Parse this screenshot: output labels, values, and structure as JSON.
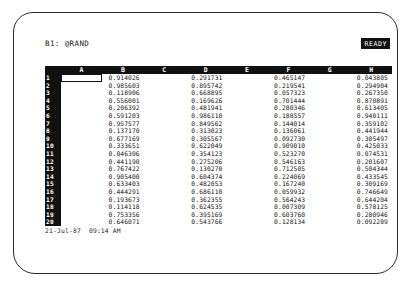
{
  "app": {
    "title": "Lotus 1-2-3 Spreadsheet",
    "screen_kind": "crt-monitor"
  },
  "control_panel": {
    "cell_reference": "B1: @RAND",
    "mode_indicator": "READY"
  },
  "worksheet": {
    "column_headers": [
      "A",
      "B",
      "C",
      "D",
      "E",
      "F",
      "G",
      "H"
    ],
    "row_numbers": [
      "1",
      "2",
      "3",
      "4",
      "5",
      "6",
      "7",
      "8",
      "9",
      "10",
      "11",
      "12",
      "13",
      "14",
      "15",
      "16",
      "17",
      "18",
      "19",
      "20"
    ],
    "active_cell": "B1",
    "rows": [
      [
        "",
        "0.914026",
        "",
        "0.291731",
        "",
        "0.465147",
        "",
        "0.043805"
      ],
      [
        "",
        "0.985603",
        "",
        "0.895742",
        "",
        "0.219541",
        "",
        "0.294904"
      ],
      [
        "",
        "0.118906",
        "",
        "0.668895",
        "",
        "0.057323",
        "",
        "0.267350"
      ],
      [
        "",
        "0.556001",
        "",
        "0.169626",
        "",
        "0.701444",
        "",
        "0.870891"
      ],
      [
        "",
        "0.206392",
        "",
        "0.481941",
        "",
        "0.280346",
        "",
        "0.613405"
      ],
      [
        "",
        "0.591203",
        "",
        "0.986110",
        "",
        "0.188557",
        "",
        "0.940111"
      ],
      [
        "",
        "0.957577",
        "",
        "0.849562",
        "",
        "0.144014",
        "",
        "0.359102"
      ],
      [
        "",
        "0.137170",
        "",
        "0.313023",
        "",
        "0.136061",
        "",
        "0.441944"
      ],
      [
        "",
        "0.677169",
        "",
        "0.305567",
        "",
        "0.092730",
        "",
        "0.305497"
      ],
      [
        "",
        "0.333651",
        "",
        "0.622049",
        "",
        "0.909010",
        "",
        "0.425033"
      ],
      [
        "",
        "0.046306",
        "",
        "0.354123",
        "",
        "0.523270",
        "",
        "0.074531"
      ],
      [
        "",
        "0.441190",
        "",
        "0.275206",
        "",
        "0.546163",
        "",
        "0.201607"
      ],
      [
        "",
        "0.767422",
        "",
        "0.130270",
        "",
        "0.712505",
        "",
        "0.504344"
      ],
      [
        "",
        "0.905400",
        "",
        "0.604374",
        "",
        "0.224069",
        "",
        "0.433545"
      ],
      [
        "",
        "0.633403",
        "",
        "0.482053",
        "",
        "0.167240",
        "",
        "0.309169"
      ],
      [
        "",
        "0.444291",
        "",
        "0.686110",
        "",
        "0.059932",
        "",
        "0.746649"
      ],
      [
        "",
        "0.193673",
        "",
        "0.362355",
        "",
        "0.564243",
        "",
        "0.644204"
      ],
      [
        "",
        "0.114118",
        "",
        "0.624535",
        "",
        "0.007309",
        "",
        "0.578125"
      ],
      [
        "",
        "0.753356",
        "",
        "0.395169",
        "",
        "0.603760",
        "",
        "0.280946"
      ],
      [
        "",
        "0.646071",
        "",
        "0.543766",
        "",
        "0.128134",
        "",
        "0.092209"
      ]
    ]
  },
  "status_bar": {
    "datetime": "21-Jul-87  09:14 AM"
  },
  "colors": {
    "screen_background": "#ffffff",
    "text": "#111111",
    "header_band": "#111111",
    "header_text": "#ffffff",
    "bezel": "#2b2b2b"
  }
}
